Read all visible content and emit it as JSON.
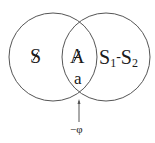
{
  "diagram": {
    "type": "venn",
    "circles": [
      {
        "id": "left",
        "cx": 53,
        "cy": 57,
        "r": 44
      },
      {
        "id": "right",
        "cx": 106,
        "cy": 57,
        "r": 44
      }
    ],
    "labels": {
      "left_region": "S",
      "intersection_top": "A",
      "intersection_bottom": "a",
      "right_region_s1": "S",
      "right_region_sub1": "1",
      "right_region_dash": "-",
      "right_region_s2": "S",
      "right_region_sub2": "2",
      "arrow_label": "−φ"
    },
    "colors": {
      "stroke": "#555555",
      "text": "#1a1a1a",
      "background": "#ffffff"
    }
  }
}
